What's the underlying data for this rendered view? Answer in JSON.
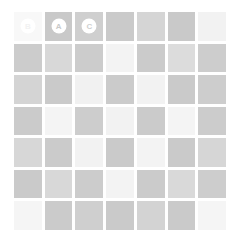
{
  "board": {
    "title": "Checkerboard Grid",
    "rows": 7,
    "cols": 7,
    "background_color": "#ffffff",
    "gap_color": "#ffffff",
    "palette": {
      "dark": "#c9c9c9",
      "medium": "#d4d4d4",
      "light": "#f2f2f2",
      "lighter": "#f7f7f7",
      "badge_bg": "#ffffff"
    },
    "cells": [
      [
        {
          "tone": "lighter",
          "color": "#f8f8f8",
          "badge": "B",
          "badge_text_color": "#f2f2f2"
        },
        {
          "tone": "dark",
          "color": "#c9c9c9",
          "badge": "A",
          "badge_text_color": "#c9c9c9"
        },
        {
          "tone": "dark",
          "color": "#cfcfcf",
          "badge": "C",
          "badge_text_color": "#cfcfcf"
        },
        {
          "tone": "dark",
          "color": "#cacaca",
          "badge": null,
          "badge_text_color": null
        },
        {
          "tone": "medium",
          "color": "#d5d5d5",
          "badge": null,
          "badge_text_color": null
        },
        {
          "tone": "dark",
          "color": "#c9c9c9",
          "badge": null,
          "badge_text_color": null
        },
        {
          "tone": "light",
          "color": "#f2f2f2",
          "badge": null,
          "badge_text_color": null
        }
      ],
      [
        {
          "tone": "dark",
          "color": "#cccccc",
          "badge": null,
          "badge_text_color": null
        },
        {
          "tone": "medium",
          "color": "#d8d8d8",
          "badge": null,
          "badge_text_color": null
        },
        {
          "tone": "dark",
          "color": "#cccccc",
          "badge": null,
          "badge_text_color": null
        },
        {
          "tone": "light",
          "color": "#f3f3f3",
          "badge": null,
          "badge_text_color": null
        },
        {
          "tone": "dark",
          "color": "#cbcbcb",
          "badge": null,
          "badge_text_color": null
        },
        {
          "tone": "medium",
          "color": "#dcdcdc",
          "badge": null,
          "badge_text_color": null
        },
        {
          "tone": "dark",
          "color": "#cdcdcd",
          "badge": null,
          "badge_text_color": null
        }
      ],
      [
        {
          "tone": "medium",
          "color": "#d4d4d4",
          "badge": null,
          "badge_text_color": null
        },
        {
          "tone": "dark",
          "color": "#cacaca",
          "badge": null,
          "badge_text_color": null
        },
        {
          "tone": "light",
          "color": "#f1f1f1",
          "badge": null,
          "badge_text_color": null
        },
        {
          "tone": "dark",
          "color": "#cbcbcb",
          "badge": null,
          "badge_text_color": null
        },
        {
          "tone": "light",
          "color": "#f2f2f2",
          "badge": null,
          "badge_text_color": null
        },
        {
          "tone": "dark",
          "color": "#cacaca",
          "badge": null,
          "badge_text_color": null
        },
        {
          "tone": "dark",
          "color": "#cdcdcd",
          "badge": null,
          "badge_text_color": null
        }
      ],
      [
        {
          "tone": "dark",
          "color": "#cbcbcb",
          "badge": null,
          "badge_text_color": null
        },
        {
          "tone": "light",
          "color": "#f4f4f4",
          "badge": null,
          "badge_text_color": null
        },
        {
          "tone": "dark",
          "color": "#cdcdcd",
          "badge": null,
          "badge_text_color": null
        },
        {
          "tone": "light",
          "color": "#f2f2f2",
          "badge": null,
          "badge_text_color": null
        },
        {
          "tone": "dark",
          "color": "#cbcbcb",
          "badge": null,
          "badge_text_color": null
        },
        {
          "tone": "light",
          "color": "#f4f4f4",
          "badge": null,
          "badge_text_color": null
        },
        {
          "tone": "dark",
          "color": "#cccccc",
          "badge": null,
          "badge_text_color": null
        }
      ],
      [
        {
          "tone": "medium",
          "color": "#d7d7d7",
          "badge": null,
          "badge_text_color": null
        },
        {
          "tone": "dark",
          "color": "#cbcbcb",
          "badge": null,
          "badge_text_color": null
        },
        {
          "tone": "light",
          "color": "#f2f2f2",
          "badge": null,
          "badge_text_color": null
        },
        {
          "tone": "dark",
          "color": "#cacaca",
          "badge": null,
          "badge_text_color": null
        },
        {
          "tone": "light",
          "color": "#f3f3f3",
          "badge": null,
          "badge_text_color": null
        },
        {
          "tone": "dark",
          "color": "#cacaca",
          "badge": null,
          "badge_text_color": null
        },
        {
          "tone": "medium",
          "color": "#d6d6d6",
          "badge": null,
          "badge_text_color": null
        }
      ],
      [
        {
          "tone": "dark",
          "color": "#cacaca",
          "badge": null,
          "badge_text_color": null
        },
        {
          "tone": "medium",
          "color": "#d8d8d8",
          "badge": null,
          "badge_text_color": null
        },
        {
          "tone": "dark",
          "color": "#cccccc",
          "badge": null,
          "badge_text_color": null
        },
        {
          "tone": "light",
          "color": "#f3f3f3",
          "badge": null,
          "badge_text_color": null
        },
        {
          "tone": "dark",
          "color": "#cbcbcb",
          "badge": null,
          "badge_text_color": null
        },
        {
          "tone": "medium",
          "color": "#d9d9d9",
          "badge": null,
          "badge_text_color": null
        },
        {
          "tone": "dark",
          "color": "#cdcdcd",
          "badge": null,
          "badge_text_color": null
        }
      ],
      [
        {
          "tone": "light",
          "color": "#f5f5f5",
          "badge": null,
          "badge_text_color": null
        },
        {
          "tone": "dark",
          "color": "#cbcbcb",
          "badge": null,
          "badge_text_color": null
        },
        {
          "tone": "dark",
          "color": "#cfcfcf",
          "badge": null,
          "badge_text_color": null
        },
        {
          "tone": "dark",
          "color": "#cacaca",
          "badge": null,
          "badge_text_color": null
        },
        {
          "tone": "medium",
          "color": "#d3d3d3",
          "badge": null,
          "badge_text_color": null
        },
        {
          "tone": "dark",
          "color": "#cacaca",
          "badge": null,
          "badge_text_color": null
        },
        {
          "tone": "light",
          "color": "#f5f5f5",
          "badge": null,
          "badge_text_color": null
        }
      ]
    ]
  }
}
